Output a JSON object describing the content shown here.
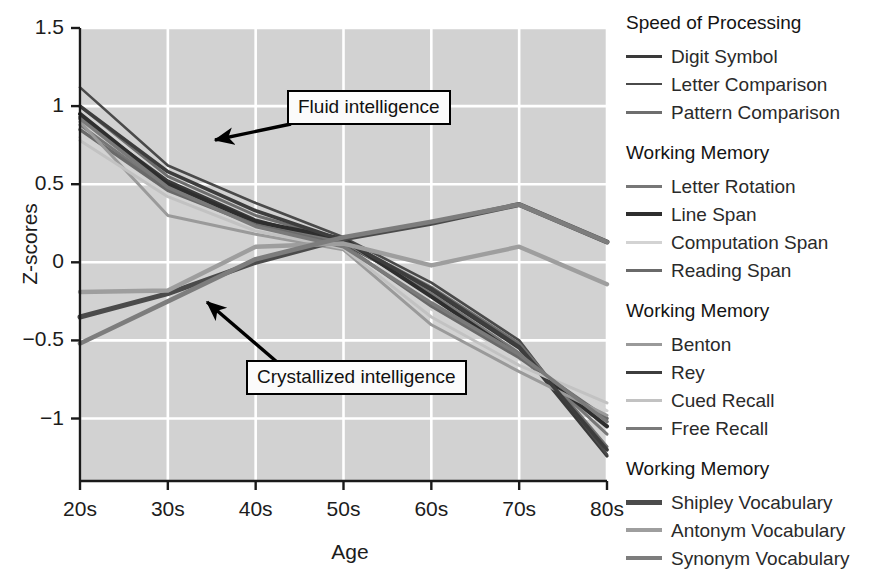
{
  "axes": {
    "ylabel": "Z-scores",
    "xlabel": "Age",
    "ytick_labels": [
      "1.5",
      "1",
      "0.5",
      "0",
      "−0.5",
      "−1"
    ],
    "xtick_labels": [
      "20s",
      "30s",
      "40s",
      "50s",
      "60s",
      "70s",
      "80s"
    ],
    "plot_bg": "#d2d2d2",
    "grid_color": "#ffffff"
  },
  "annotations": [
    {
      "name": "fluid-intelligence",
      "text": "Fluid intelligence"
    },
    {
      "name": "crystallized-intelligence",
      "text": "Crystallized intelligence"
    }
  ],
  "legend": {
    "groups": [
      {
        "title": "Speed of Processing",
        "items": [
          {
            "label": "Digit Symbol",
            "color": "#3a3a3a",
            "width": 3.2
          },
          {
            "label": "Letter Comparison",
            "color": "#4a4a4a",
            "width": 2.6
          },
          {
            "label": "Pattern Comparison",
            "color": "#6e6e6e",
            "width": 3.0
          }
        ]
      },
      {
        "title": "Working Memory",
        "items": [
          {
            "label": "Letter Rotation",
            "color": "#777777",
            "width": 3.0
          },
          {
            "label": "Line Span",
            "color": "#2e2e2e",
            "width": 4.0
          },
          {
            "label": "Computation Span",
            "color": "#d3d3d3",
            "width": 3.0
          },
          {
            "label": "Reading Span",
            "color": "#6a6a6a",
            "width": 3.4
          }
        ]
      },
      {
        "title": "Working Memory",
        "items": [
          {
            "label": "Benton",
            "color": "#9a9a9a",
            "width": 3.0
          },
          {
            "label": "Rey",
            "color": "#3d3d3d",
            "width": 3.6
          },
          {
            "label": "Cued Recall",
            "color": "#c2c2c2",
            "width": 3.0
          },
          {
            "label": "Free Recall",
            "color": "#7a7a7a",
            "width": 3.6
          }
        ]
      },
      {
        "title": "Working Memory",
        "items": [
          {
            "label": "Shipley Vocabulary",
            "color": "#4b4b4b",
            "width": 5.0
          },
          {
            "label": "Antonym Vocabulary",
            "color": "#9e9e9e",
            "width": 4.4
          },
          {
            "label": "Synonym Vocabulary",
            "color": "#7d7d7d",
            "width": 4.6
          }
        ]
      }
    ]
  },
  "chart_data": {
    "type": "line",
    "title": "",
    "xlabel": "Age",
    "ylabel": "Z-scores",
    "x": [
      "20s",
      "30s",
      "40s",
      "50s",
      "60s",
      "70s",
      "80s"
    ],
    "ylim": [
      -1.4,
      1.5
    ],
    "xlim": [
      0,
      6
    ],
    "grid": true,
    "legend_position": "right",
    "series": [
      {
        "name": "Digit Symbol",
        "group": "Speed of Processing",
        "color": "#3a3a3a",
        "width": 3.2,
        "values": [
          0.93,
          0.52,
          0.27,
          0.12,
          -0.18,
          -0.55,
          -1.24
        ]
      },
      {
        "name": "Letter Comparison",
        "group": "Speed of Processing",
        "color": "#4a4a4a",
        "width": 2.6,
        "values": [
          1.12,
          0.62,
          0.38,
          0.16,
          -0.13,
          -0.5,
          -1.23
        ]
      },
      {
        "name": "Pattern Comparison",
        "group": "Speed of Processing",
        "color": "#6e6e6e",
        "width": 3.0,
        "values": [
          1.0,
          0.55,
          0.3,
          0.14,
          -0.16,
          -0.52,
          -1.18
        ]
      },
      {
        "name": "Letter Rotation",
        "group": "Working Memory",
        "color": "#777777",
        "width": 3.0,
        "values": [
          0.88,
          0.47,
          0.25,
          0.13,
          -0.2,
          -0.58,
          -1.1
        ]
      },
      {
        "name": "Line Span",
        "group": "Working Memory",
        "color": "#2e2e2e",
        "width": 4.0,
        "values": [
          0.95,
          0.5,
          0.26,
          0.15,
          -0.22,
          -0.6,
          -1.05
        ]
      },
      {
        "name": "Computation Span",
        "group": "Working Memory",
        "color": "#d3d3d3",
        "width": 3.0,
        "values": [
          0.8,
          0.44,
          0.22,
          0.1,
          -0.3,
          -0.62,
          -0.95
        ]
      },
      {
        "name": "Reading Span",
        "group": "Working Memory",
        "color": "#6a6a6a",
        "width": 3.4,
        "values": [
          0.85,
          0.46,
          0.24,
          0.11,
          -0.28,
          -0.61,
          -1.0
        ]
      },
      {
        "name": "Benton",
        "group": "Working Memory",
        "color": "#9a9a9a",
        "width": 3.0,
        "values": [
          0.9,
          0.3,
          0.18,
          0.08,
          -0.4,
          -0.7,
          -0.98
        ]
      },
      {
        "name": "Rey",
        "group": "Working Memory",
        "color": "#3d3d3d",
        "width": 3.6,
        "values": [
          1.0,
          0.58,
          0.33,
          0.14,
          -0.17,
          -0.54,
          -1.2
        ]
      },
      {
        "name": "Cued Recall",
        "group": "Working Memory",
        "color": "#c2c2c2",
        "width": 3.0,
        "values": [
          0.78,
          0.42,
          0.2,
          0.09,
          -0.35,
          -0.66,
          -0.9
        ]
      },
      {
        "name": "Free Recall",
        "group": "Working Memory",
        "color": "#7a7a7a",
        "width": 3.6,
        "values": [
          0.92,
          0.48,
          0.23,
          0.1,
          -0.26,
          -0.59,
          -1.02
        ]
      },
      {
        "name": "Shipley Vocabulary",
        "group": "Working Memory",
        "color": "#4b4b4b",
        "width": 5.0,
        "values": [
          -0.35,
          -0.2,
          0.0,
          0.15,
          0.25,
          0.37,
          0.13
        ]
      },
      {
        "name": "Antonym Vocabulary",
        "group": "Working Memory",
        "color": "#9e9e9e",
        "width": 4.4,
        "values": [
          -0.19,
          -0.18,
          0.1,
          0.12,
          -0.02,
          0.1,
          -0.14
        ]
      },
      {
        "name": "Synonym Vocabulary",
        "group": "Working Memory",
        "color": "#7d7d7d",
        "width": 4.6,
        "values": [
          -0.52,
          -0.25,
          0.02,
          0.16,
          0.26,
          0.37,
          0.13
        ]
      }
    ]
  }
}
